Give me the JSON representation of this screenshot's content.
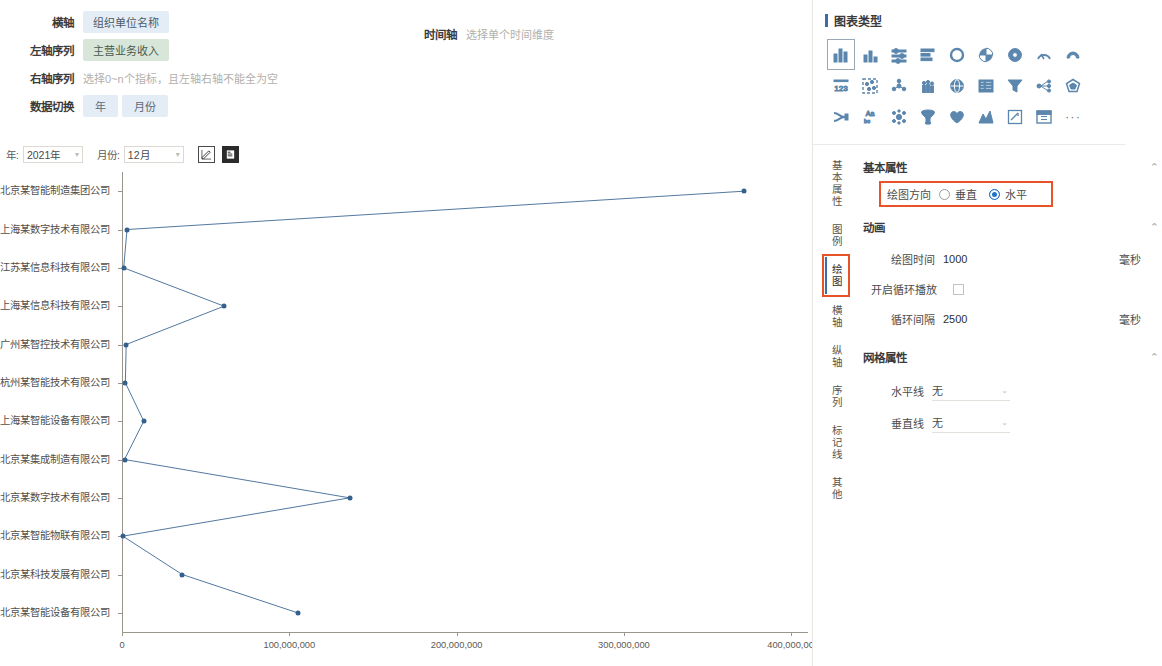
{
  "config": {
    "x_axis_label": "横轴",
    "x_axis_value": "组织单位名称",
    "left_series_label": "左轴序列",
    "left_series_value": "主营业务收入",
    "right_series_label": "右轴序列",
    "right_series_placeholder": "选择0~n个指标，且左轴右轴不能全为空",
    "data_switch_label": "数据切换",
    "data_switch_options": [
      "年",
      "月份"
    ],
    "timeline_label": "时间轴",
    "timeline_placeholder": "选择单个时间维度",
    "year_label": "年:",
    "year_value": "2021年",
    "month_label": "月份:",
    "month_value": "12月",
    "edit_icon": "edit-square-icon",
    "export_icon": "export-doc-icon"
  },
  "right_panel": {
    "title": "图表类型",
    "chart_type_icons": [
      "bar-chart-icon",
      "column-chart-icon",
      "dot-plot-icon",
      "horizontal-bar-icon",
      "ring-icon",
      "pie-icon",
      "donut-icon",
      "gauge-icon",
      "half-gauge-icon",
      "number-123-icon",
      "scatter-matrix-icon",
      "network-icon",
      "pictogram-icon",
      "globe-icon",
      "table-icon",
      "funnel-icon",
      "tree-icon",
      "radar-icon",
      "sankey-icon",
      "word-cloud-icon",
      "bubble-cluster-icon",
      "funnel-3d-icon",
      "heart-map-icon",
      "mountain-area-icon",
      "edit-chart-icon",
      "calendar-icon",
      "more-icon"
    ],
    "tabs": [
      {
        "label": "基本属性",
        "active": false
      },
      {
        "label": "图例",
        "active": false
      },
      {
        "label": "绘图",
        "active": true,
        "highlighted": true
      },
      {
        "label": "横轴",
        "active": false
      },
      {
        "label": "纵轴",
        "active": false
      },
      {
        "label": "序列",
        "active": false
      },
      {
        "label": "标记线",
        "active": false
      },
      {
        "label": "其他",
        "active": false
      }
    ],
    "basic_section": {
      "title": "基本属性",
      "direction_label": "绘图方向",
      "direction_vertical": "垂直",
      "direction_horizontal": "水平",
      "direction_selected": "水平"
    },
    "animation_section": {
      "title": "动画",
      "draw_time_label": "绘图时间",
      "draw_time_value": "1000",
      "draw_time_unit": "毫秒",
      "loop_label": "开启循环播放",
      "loop_checked": false,
      "loop_interval_label": "循环间隔",
      "loop_interval_value": "2500",
      "loop_interval_unit": "毫秒"
    },
    "grid_section": {
      "title": "网格属性",
      "horizontal_line_label": "水平线",
      "horizontal_line_value": "无",
      "vertical_line_label": "垂直线",
      "vertical_line_value": "无"
    },
    "accent_color": "#3a6ea5",
    "highlight_color": "#e8532a"
  },
  "chart_data": {
    "type": "line",
    "title": "",
    "xlabel": "",
    "ylabel": "",
    "orientation": "horizontal",
    "grid": false,
    "legend": "none",
    "series_name": "主营业务收入",
    "series_color": "#34608d",
    "xlim": [
      0,
      410000000
    ],
    "xticks": [
      0,
      100000000,
      200000000,
      300000000,
      400000000
    ],
    "xtick_labels": [
      "0",
      "100,000,000",
      "200,000,000",
      "300,000,000",
      "400,000,0C"
    ],
    "categories": [
      "北京某智能制造集团公司",
      "上海某数字技术有限公司",
      "江苏某信息科技有限公司",
      "上海某信息科技有限公司",
      "广州某智控技术有限公司",
      "杭州某智能技术有限公司",
      "上海某智能设备有限公司",
      "北京某集成制造有限公司",
      "北京某数字技术有限公司",
      "北京某智能物联有限公司",
      "北京某科技发展有限公司",
      "北京某智能设备有限公司"
    ],
    "values": [
      372000000,
      3000000,
      1000000,
      61000000,
      2500000,
      2000000,
      13000000,
      1500000,
      136000000,
      500000,
      36000000,
      105000000
    ]
  }
}
